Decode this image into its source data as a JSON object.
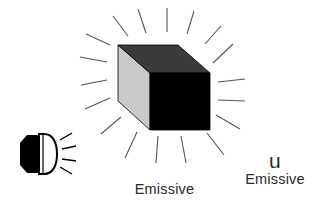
{
  "canvas": {
    "width": 325,
    "height": 215,
    "background_color": "#ffffff"
  },
  "figure": {
    "title_center": "Emissive",
    "label_u": "u",
    "label_emissive_right": "Emissive",
    "text_color": "#2b2b2b"
  },
  "cube": {
    "name": "emissive-cube",
    "front_face_color": "#000000",
    "top_face_color": "#3b3b3b",
    "left_face_color": "#c9c9c9",
    "outline_color": "#000000",
    "geometry": {
      "front_face": "150,73 210,73 210,130 150,130",
      "top_face": "150,73 118,45 178,45 210,73",
      "left_face": "118,45 150,73 150,130 118,101"
    }
  },
  "glow": {
    "name": "emissive-glow-rays",
    "color": "#555555",
    "ray_count": 18,
    "stroke_width": 1.1
  },
  "lamp": {
    "name": "light-source-lamp",
    "body_color": "#000000",
    "lens_color": "#ffffff",
    "rim_color": "#000000",
    "ray_color": "#000000",
    "ray_count": 4,
    "position": {
      "x": 18,
      "y": 132,
      "width": 40,
      "height": 44
    }
  }
}
